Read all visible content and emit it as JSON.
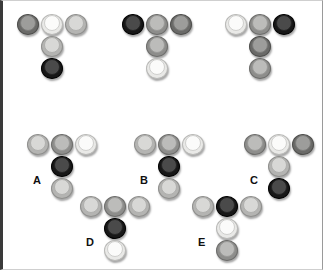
{
  "panel": {
    "background": "#ffffff",
    "border_color": "#3a3a3a"
  },
  "legend": {
    "shades": {
      "white": "#fbfbfa",
      "light": "#d8d8d6",
      "gray": "#bcbcba",
      "dark": "#9d9d9b",
      "black": "#171717"
    }
  },
  "puzzle": {
    "question_row": {
      "label": "",
      "groups": [
        {
          "id": "q1",
          "label": "",
          "x": 14,
          "y": 12,
          "tokens": [
            {
              "name": "token-top-left",
              "shade": "dark",
              "col": 0,
              "row": 0
            },
            {
              "name": "token-top-center",
              "shade": "white",
              "col": 1,
              "row": 0
            },
            {
              "name": "token-top-right",
              "shade": "light",
              "col": 2,
              "row": 0
            },
            {
              "name": "token-middle",
              "shade": "light",
              "col": 1,
              "row": 1
            },
            {
              "name": "token-bottom",
              "shade": "black",
              "col": 1,
              "row": 2
            }
          ]
        },
        {
          "id": "q2",
          "label": "",
          "x": 119,
          "y": 12,
          "tokens": [
            {
              "name": "token-top-left",
              "shade": "black",
              "col": 0,
              "row": 0
            },
            {
              "name": "token-top-center",
              "shade": "gray",
              "col": 1,
              "row": 0
            },
            {
              "name": "token-top-right",
              "shade": "dark",
              "col": 2,
              "row": 0
            },
            {
              "name": "token-middle",
              "shade": "gray",
              "col": 1,
              "row": 1
            },
            {
              "name": "token-bottom",
              "shade": "white",
              "col": 1,
              "row": 2
            }
          ]
        },
        {
          "id": "q3",
          "label": "",
          "x": 222,
          "y": 12,
          "tokens": [
            {
              "name": "token-top-left",
              "shade": "white",
              "col": 0,
              "row": 0
            },
            {
              "name": "token-top-center",
              "shade": "gray",
              "col": 1,
              "row": 0
            },
            {
              "name": "token-top-right",
              "shade": "black",
              "col": 2,
              "row": 0
            },
            {
              "name": "token-middle",
              "shade": "dark",
              "col": 1,
              "row": 1
            },
            {
              "name": "token-bottom",
              "shade": "gray",
              "col": 1,
              "row": 2
            }
          ]
        }
      ]
    },
    "answer_row": {
      "options": [
        {
          "id": "A",
          "label": "A",
          "x": 24,
          "y": 132,
          "label_x": 30,
          "label_y": 174,
          "tokens": [
            {
              "name": "token-top-left",
              "shade": "light",
              "col": 0,
              "row": 0
            },
            {
              "name": "token-top-center",
              "shade": "gray",
              "col": 1,
              "row": 0
            },
            {
              "name": "token-top-right",
              "shade": "white",
              "col": 2,
              "row": 0
            },
            {
              "name": "token-middle",
              "shade": "black",
              "col": 1,
              "row": 1
            },
            {
              "name": "token-bottom",
              "shade": "light",
              "col": 1,
              "row": 2
            }
          ]
        },
        {
          "id": "B",
          "label": "B",
          "x": 131,
          "y": 132,
          "label_x": 137,
          "label_y": 174,
          "tokens": [
            {
              "name": "token-top-left",
              "shade": "light",
              "col": 0,
              "row": 0
            },
            {
              "name": "token-top-center",
              "shade": "gray",
              "col": 1,
              "row": 0
            },
            {
              "name": "token-top-right",
              "shade": "white",
              "col": 2,
              "row": 0
            },
            {
              "name": "token-middle",
              "shade": "black",
              "col": 1,
              "row": 1
            },
            {
              "name": "token-bottom",
              "shade": "light",
              "col": 1,
              "row": 2
            }
          ]
        },
        {
          "id": "C",
          "label": "C",
          "x": 241,
          "y": 132,
          "label_x": 247,
          "label_y": 174,
          "tokens": [
            {
              "name": "token-top-left",
              "shade": "gray",
              "col": 0,
              "row": 0
            },
            {
              "name": "token-top-center",
              "shade": "white",
              "col": 1,
              "row": 0
            },
            {
              "name": "token-top-right",
              "shade": "dark",
              "col": 2,
              "row": 0
            },
            {
              "name": "token-middle",
              "shade": "light",
              "col": 1,
              "row": 1
            },
            {
              "name": "token-bottom",
              "shade": "black",
              "col": 1,
              "row": 2
            }
          ]
        },
        {
          "id": "D",
          "label": "D",
          "x": 77,
          "y": 194,
          "label_x": 83,
          "label_y": 236,
          "tokens": [
            {
              "name": "token-top-left",
              "shade": "light",
              "col": 0,
              "row": 0
            },
            {
              "name": "token-top-center",
              "shade": "gray",
              "col": 1,
              "row": 0
            },
            {
              "name": "token-top-right",
              "shade": "light",
              "col": 2,
              "row": 0
            },
            {
              "name": "token-middle",
              "shade": "black",
              "col": 1,
              "row": 1
            },
            {
              "name": "token-bottom",
              "shade": "white",
              "col": 1,
              "row": 2
            }
          ]
        },
        {
          "id": "E",
          "label": "E",
          "x": 189,
          "y": 194,
          "label_x": 195,
          "label_y": 236,
          "tokens": [
            {
              "name": "token-top-left",
              "shade": "light",
              "col": 0,
              "row": 0
            },
            {
              "name": "token-top-center",
              "shade": "black",
              "col": 1,
              "row": 0
            },
            {
              "name": "token-top-right",
              "shade": "light",
              "col": 2,
              "row": 0
            },
            {
              "name": "token-middle",
              "shade": "white",
              "col": 1,
              "row": 1
            },
            {
              "name": "token-bottom",
              "shade": "gray",
              "col": 1,
              "row": 2
            }
          ]
        }
      ]
    },
    "layout": {
      "token_size": 20,
      "col_step": 24,
      "row_step": 22
    }
  }
}
